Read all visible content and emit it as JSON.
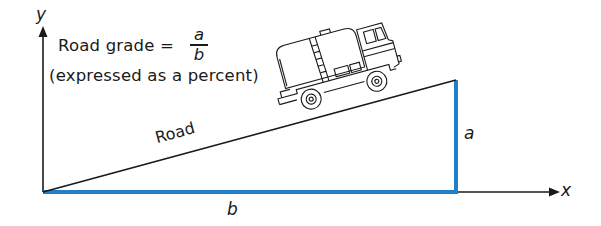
{
  "diagram": {
    "formula": {
      "prefix": "Road grade =",
      "numerator": "a",
      "denominator": "b",
      "note": "(expressed as a percent)"
    },
    "axes": {
      "y_label": "y",
      "x_label": "x"
    },
    "labels": {
      "road": "Road",
      "rise": "a",
      "run": "b"
    },
    "vehicle": "tanker-truck",
    "colors": {
      "highlight": "#1f7fc8",
      "ink": "#1a1a1a"
    }
  }
}
